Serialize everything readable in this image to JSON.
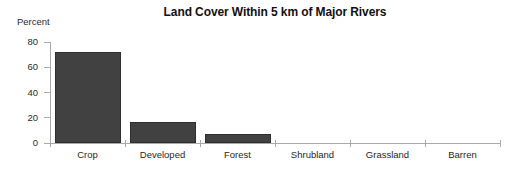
{
  "chart_data": {
    "type": "bar",
    "title": "Land Cover Within 5 km of Major Rivers",
    "xlabel": "",
    "ylabel": "Percent",
    "categories": [
      "Crop",
      "Developed",
      "Forest",
      "Shrubland",
      "Grassland",
      "Barren"
    ],
    "values": [
      72,
      17,
      7,
      0,
      0,
      0
    ],
    "ylim": [
      0,
      80
    ],
    "yticks": [
      0,
      20,
      40,
      60,
      80
    ],
    "ytick_labels": [
      "0",
      "20",
      "40",
      "60",
      "80"
    ],
    "grid": false,
    "legend": null,
    "legend_position": "none",
    "bar_color": "#414141",
    "axis_color": "#a9a9a9",
    "background_color": "#ffffff"
  }
}
